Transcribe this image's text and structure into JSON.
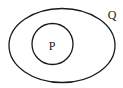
{
  "diagram": {
    "type": "euler-subset",
    "sets": [
      {
        "id": "Q",
        "label": "Q",
        "shape": "ellipse",
        "cx": 62,
        "cy": 45,
        "rx": 53,
        "ry": 37
      },
      {
        "id": "P",
        "label": "P",
        "shape": "circle",
        "cx": 52,
        "cy": 44,
        "r": 20,
        "parent": "Q"
      }
    ],
    "labels": {
      "outer": "Q",
      "inner": "P"
    },
    "colors": {
      "stroke": "#1a1a1a",
      "background": "#ffffff"
    }
  }
}
